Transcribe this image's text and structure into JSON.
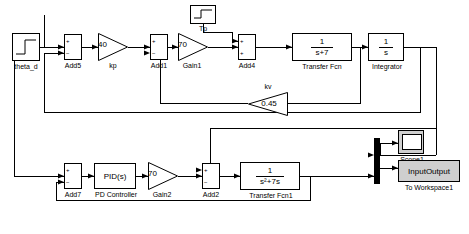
{
  "diagram": {
    "blocks": {
      "step": {
        "label": "theta_d",
        "sym": "step"
      },
      "add5": {
        "label": "Add5",
        "signs": [
          "+",
          "−"
        ]
      },
      "kp": {
        "label": "kp",
        "gain": "40"
      },
      "add1": {
        "label": "Add1",
        "signs": [
          "+",
          "−"
        ]
      },
      "gain1": {
        "label": "Gain1",
        "gain": "70"
      },
      "tp": {
        "label": "Tp",
        "sym": "constant"
      },
      "add4": {
        "label": "Add4",
        "signs": [
          "+",
          "+"
        ]
      },
      "transfer_fcn": {
        "label": "Transfer Fcn",
        "num": "1",
        "den": "s+7"
      },
      "integrator": {
        "label": "Integrator",
        "num": "1",
        "den": "s"
      },
      "kv": {
        "label": "kv",
        "gain": "0.45"
      },
      "add7": {
        "label": "Add7",
        "signs": [
          "+",
          "−"
        ]
      },
      "pd": {
        "label": "PD Controller",
        "text": "PID(s)"
      },
      "gain2": {
        "label": "Gain2",
        "gain": "70"
      },
      "add2": {
        "label": "Add2",
        "signs": [
          "+",
          "−"
        ]
      },
      "transfer_fcn1": {
        "label": "Transfer Fcn1",
        "num": "1",
        "den": "s²+7s"
      },
      "scope1": {
        "label": "Scope1"
      },
      "mux": {
        "label": "mux"
      },
      "to_workspace": {
        "label": "To Workspace1",
        "text": "InputOutput"
      }
    }
  }
}
